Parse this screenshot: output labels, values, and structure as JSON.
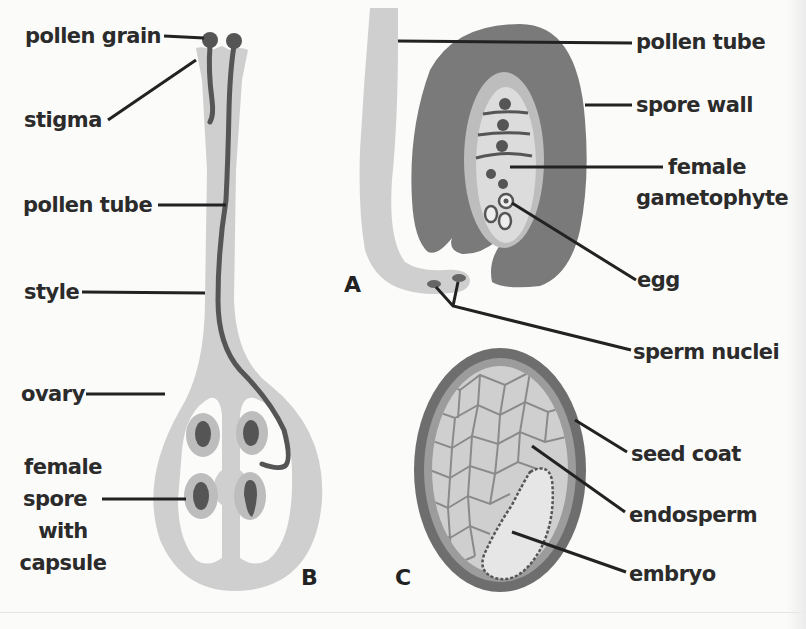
{
  "figure": {
    "panels": [
      {
        "id": "B",
        "letter": "B",
        "subject": "pistil"
      },
      {
        "id": "A",
        "letter": "A",
        "subject": "ovule with pollen tube"
      },
      {
        "id": "C",
        "letter": "C",
        "subject": "seed"
      }
    ],
    "colors": {
      "background": "#fbfbfa",
      "light_tissue": "#cfcfcf",
      "mid_tissue": "#bdbdbd",
      "dark_tissue": "#7a7a7a",
      "nucleus": "#555555",
      "line": "#222222",
      "text": "#2b2b2b"
    }
  },
  "panel_b": {
    "letter": "B",
    "labels": {
      "pollen_grain": "pollen grain",
      "stigma": "stigma",
      "pollen_tube": "pollen tube",
      "style": "style",
      "ovary": "ovary",
      "female_spore_line1": "female",
      "female_spore_line2": "spore",
      "female_spore_line3": "with",
      "female_spore_line4": "capsule"
    }
  },
  "panel_a": {
    "letter": "A",
    "labels": {
      "pollen_tube": "pollen tube",
      "spore_wall": "spore wall",
      "female_gametophyte_line1": "female",
      "female_gametophyte_line2": "gametophyte",
      "egg": "egg",
      "sperm_nuclei": "sperm nuclei"
    }
  },
  "panel_c": {
    "letter": "C",
    "labels": {
      "seed_coat": "seed coat",
      "endosperm": "endosperm",
      "embryo": "embryo"
    }
  }
}
